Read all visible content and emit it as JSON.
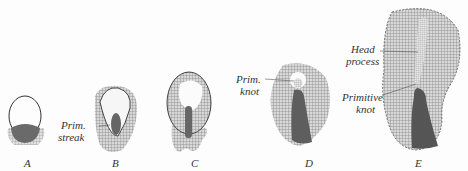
{
  "figure": {
    "stages": [
      {
        "id": "A",
        "label": "A"
      },
      {
        "id": "B",
        "label": "B",
        "annotation_line1": "Prim.",
        "annotation_line2": "streak"
      },
      {
        "id": "C",
        "label": "C"
      },
      {
        "id": "D",
        "label": "D",
        "annotation_line1": "Prim.",
        "annotation_line2": "knot"
      },
      {
        "id": "E",
        "label": "E",
        "annotation_head_line1": "Head",
        "annotation_head_line2": "process",
        "annotation_knot_line1": "Primitive",
        "annotation_knot_line2": "knot"
      }
    ],
    "colors": {
      "outline": "#333333",
      "hatch": "#8a8a8a",
      "dark": "#5a5a5a",
      "light": "#f4f4f4"
    }
  }
}
